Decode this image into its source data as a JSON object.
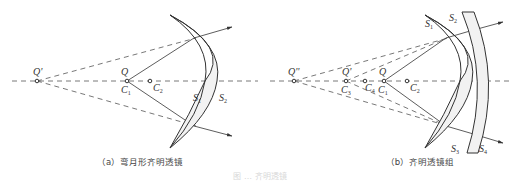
{
  "figure": {
    "caption": "图 … 齐明透镜",
    "panels": [
      {
        "id": "a",
        "caption": "（a）弯月形齐明透镜",
        "points": [
          {
            "label": "Q'",
            "sub": "",
            "x": 37
          },
          {
            "label": "Q",
            "sub": "",
            "x": 127,
            "below": "C",
            "below_sub": "1"
          },
          {
            "label": "C",
            "sub": "2",
            "x": 150
          }
        ],
        "surfaces": [
          "S1",
          "S2"
        ],
        "surface_labels": {
          "s1": "S",
          "s1_sub": "1",
          "s2": "S",
          "s2_sub": "2"
        }
      },
      {
        "id": "b",
        "caption": "（b）齐明透镜组",
        "points": [
          {
            "label": "Q''",
            "x": 294
          },
          {
            "label": "Q'",
            "x": 346,
            "below": "C",
            "below_sub": "3"
          },
          {
            "label": "C",
            "sub": "4",
            "x": 365
          },
          {
            "label": "Q",
            "x": 384,
            "below": "C",
            "below_sub": "1"
          },
          {
            "label": "C",
            "sub": "2",
            "x": 407
          }
        ],
        "surfaces": [
          "S1",
          "S2",
          "S3",
          "S4"
        ],
        "surface_labels": {
          "s1": "S",
          "s1_sub": "1",
          "s2": "S",
          "s2_sub": "2",
          "s3": "S",
          "s3_sub": "3",
          "s4": "S",
          "s4_sub": "4"
        }
      }
    ],
    "colors": {
      "line": "#333333",
      "dash": "#555555",
      "lens_fill": "#f2f2f2",
      "text": "#333333"
    }
  }
}
